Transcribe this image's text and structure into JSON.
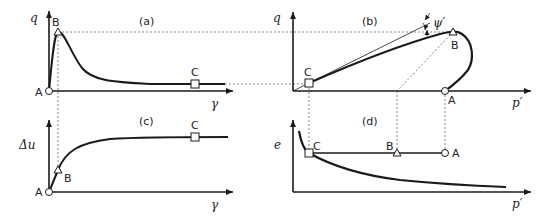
{
  "figure": {
    "panels": [
      {
        "id": "a",
        "label": "(a)",
        "xlabel": "γ",
        "ylabel": "q"
      },
      {
        "id": "b",
        "label": "(b)",
        "xlabel": "p′",
        "ylabel": "q",
        "angle_label": "ψ′"
      },
      {
        "id": "c",
        "label": "(c)",
        "xlabel": "γ",
        "ylabel": "Δu"
      },
      {
        "id": "d",
        "label": "(d)",
        "xlabel": "p′",
        "ylabel": "e"
      }
    ],
    "points": {
      "A": "A",
      "B": "B",
      "C": "C"
    },
    "colors": {
      "line": "#1a1a1a",
      "guide": "#555555"
    }
  }
}
